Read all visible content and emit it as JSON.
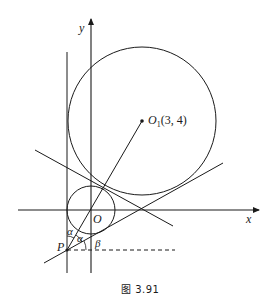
{
  "figure": {
    "caption": "图 3.91",
    "colors": {
      "line": "#1a1a1a",
      "background": "#ffffff"
    }
  },
  "labels": {
    "y_axis": "y",
    "x_axis": "x",
    "origin": "O",
    "center_name": "O",
    "center_sub": "1",
    "center_coords": "(3, 4)",
    "point_p": "P",
    "alpha1": "α",
    "alpha2": "α",
    "beta": "β"
  },
  "geometry": {
    "origin": [
      91,
      210
    ],
    "big_circle": {
      "cx": 142,
      "cy": 121,
      "r": 74
    },
    "small_circle": {
      "cx": 91,
      "cy": 210,
      "r": 24
    },
    "point_p": [
      67,
      250
    ],
    "center_point": [
      142,
      121
    ]
  }
}
